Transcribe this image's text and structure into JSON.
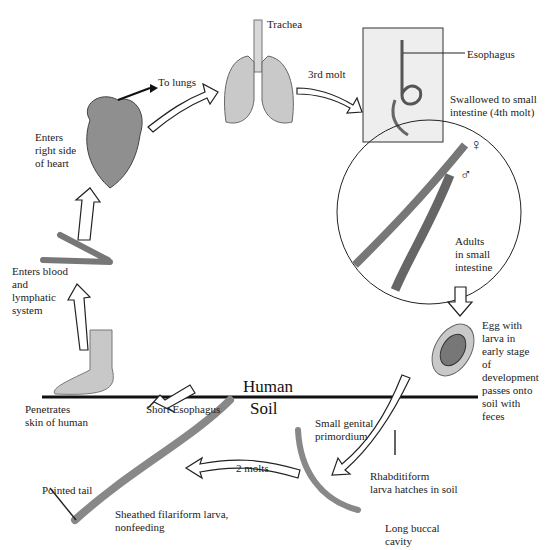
{
  "diagram": {
    "zones": {
      "upper": "Human",
      "lower": "Soil"
    },
    "labels": {
      "trachea": "Trachea",
      "to_lungs": "To lungs",
      "third_molt": "3rd molt",
      "esophagus": "Esophagus",
      "swallowed": "Swallowed to small\nintestine (4th molt)",
      "heart": "Enters\nright side\nof heart",
      "blood": "Enters blood\nand\nlymphatic\nsystem",
      "adults": "Adults\nin small\nintestine",
      "egg": "Egg with\nlarva in\nearly stage\nof\ndevelopment\npasses onto\nsoil with\nfeces",
      "penetrates": "Penetrates\nskin of human",
      "short_esophagus": "Short Esophagus",
      "genital": "Small genital\nprimordium",
      "two_molts": "2 molts",
      "rhabditiform": "Rhabditiform\nlarva hatches in soil",
      "pointed_tail": "Pointed tail",
      "filariform": "Sheathed filariform larva,\nnonfeeding",
      "buccal": "Long buccal\ncavity",
      "female_symbol": "♀",
      "male_symbol": "♂"
    },
    "colors": {
      "organ": "#8a8a8a",
      "light": "#cfcfcf",
      "line": "#111111"
    }
  }
}
